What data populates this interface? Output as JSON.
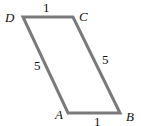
{
  "diagram": {
    "type": "parallelogram",
    "vertices": [
      {
        "name": "A",
        "x": 68,
        "y": 113
      },
      {
        "name": "B",
        "x": 120,
        "y": 113
      },
      {
        "name": "C",
        "x": 73,
        "y": 17
      },
      {
        "name": "D",
        "x": 23,
        "y": 17
      }
    ],
    "labels": {
      "A": "A",
      "B": "B",
      "C": "C",
      "D": "D"
    },
    "side_lengths": {
      "DC": "1",
      "AB": "1",
      "DA": "5",
      "CB": "5"
    },
    "stroke_color": "#7a7a7a"
  }
}
